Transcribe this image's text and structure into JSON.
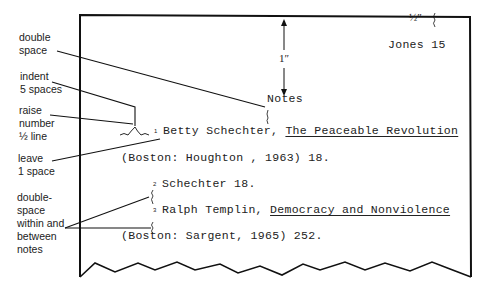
{
  "annotations": {
    "double_space": [
      "double",
      "space"
    ],
    "indent": [
      "indent",
      "5 spaces"
    ],
    "raise": [
      "raise",
      "number",
      "½ line"
    ],
    "leave": [
      "leave",
      "1 space"
    ],
    "double_space_notes": [
      "double-",
      "space",
      "within and",
      "between",
      "notes"
    ]
  },
  "page": {
    "margin_top_label": "½″",
    "running_head": "Jones 15",
    "margin_label": "1″",
    "heading": "Notes",
    "notes": [
      {
        "number": "1",
        "author": "Betty Schechter,",
        "title": "The Peaceable Revolution",
        "continuation": "(Boston: Houghton , 1963)  18."
      },
      {
        "number": "2",
        "text": "Schechter  18."
      },
      {
        "number": "3",
        "author": "Ralph Templin,",
        "title": "Democracy and Nonviolence",
        "continuation": "(Boston: Sargent, 1965) 252."
      }
    ]
  },
  "colors": {
    "ink": "#222222",
    "background": "#ffffff"
  }
}
